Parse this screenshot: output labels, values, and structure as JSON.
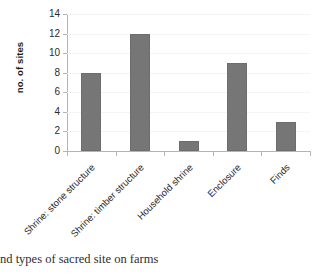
{
  "caption": {
    "text": "nd types of sacred site on farms"
  },
  "chart_data": {
    "type": "bar",
    "title": "",
    "subtitle": "",
    "xlabel": "",
    "ylabel": "no. of sites",
    "categories": [
      "Shrine: stone structure",
      "Shrine: timber structure",
      "Household shrine",
      "Enclosure",
      "Finds"
    ],
    "values": [
      8,
      12,
      1,
      9,
      3
    ],
    "ylim": [
      0,
      14
    ],
    "ytick_labels": [
      "0",
      "2",
      "4",
      "6",
      "8",
      "10",
      "12",
      "14"
    ],
    "ytick_values": [
      0,
      2,
      4,
      6,
      8,
      10,
      12,
      14
    ],
    "grid": true,
    "grid_axis": "y",
    "legend": false,
    "legend_position": "none",
    "bar_color": "#767676",
    "grid_color": "#f4f4f4",
    "axis_color": "#b4b4b4",
    "text_color": "#2b2b2b",
    "background": "#ffffff",
    "xtick_label_rotation": -45
  }
}
